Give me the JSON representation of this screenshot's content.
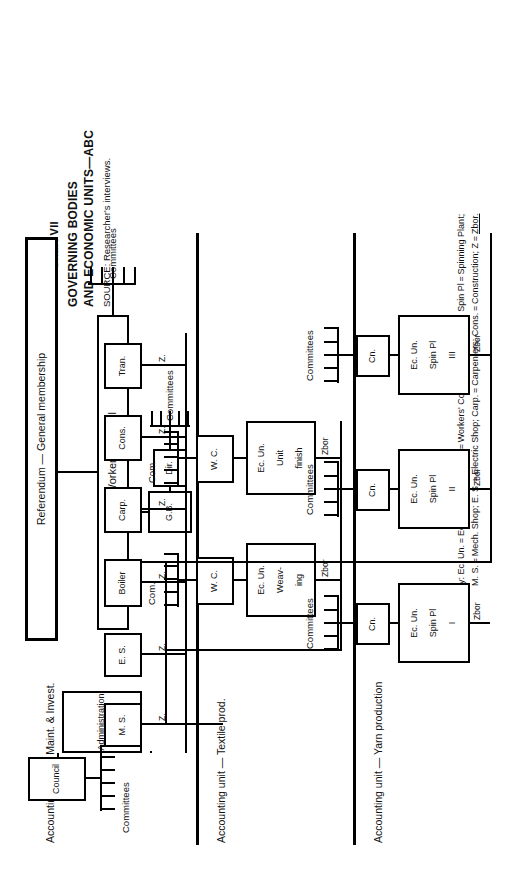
{
  "chart": {
    "number": "Chart VII",
    "title_line1": "GOVERNING BODIES",
    "title_line2": "AND ECONOMIC UNITS—ABC",
    "source": "SOURCE: Researcher's interviews."
  },
  "top": {
    "referendum": "Referendum — General membership",
    "central_workers_council": "Central Workers' Council",
    "committees": "Committees",
    "gb": "G.B.",
    "dir": "Dir.",
    "gb_committees": "Committees"
  },
  "accounting_units": {
    "maint": "Accounting unit — Maint. & Invest.",
    "textile": "Accounting unit — Textile prod.",
    "yarn": "Accounting unit — Yarn production"
  },
  "maint_branch": {
    "administration": "Administration",
    "council": "Council",
    "committees": "Committees",
    "z_label": "Z.",
    "departments": [
      "M. S.",
      "E. S.",
      "Boiler",
      "Carp.",
      "Cons.",
      "Tran."
    ]
  },
  "textile_branch": {
    "zbor": "Zbor",
    "units": [
      {
        "name_line1": "Ec. Un.",
        "name_line2": "Weav-",
        "name_line3": "ing",
        "council": "W. C.",
        "committees": "Com."
      },
      {
        "name_line1": "Ec. Un.",
        "name_line2": "Unit",
        "name_line3": "finish",
        "council": "W. C.",
        "committees": "Com."
      }
    ]
  },
  "yarn_branch": {
    "zbor": "Zbor",
    "units": [
      {
        "name_line1": "Ec. Un.",
        "name_line2": "Spin Pl",
        "name_line3": "I",
        "council": "Cn.",
        "committees": "Committees"
      },
      {
        "name_line1": "Ec. Un.",
        "name_line2": "Spin Pl",
        "name_line3": "II",
        "council": "Cn.",
        "committees": "Committees"
      },
      {
        "name_line1": "Ec. Un.",
        "name_line2": "Spin Pl",
        "name_line3": "III",
        "council": "Cn.",
        "committees": "Committees"
      }
    ]
  },
  "key": {
    "line1": "Key: Ec. Un. = Economic Unit; W. C. = Workers' Council; Cn. = Council; Spin Pl = Spinning Plant;",
    "line2_a": "M. S. = Mech. Shop; E. S. = Electric Shop; Carp. = Carpenters; Cons. = Construction; Z = ",
    "line2_b": "Zbor."
  },
  "colors": {
    "ink": "#111111",
    "paper": "#ffffff"
  }
}
